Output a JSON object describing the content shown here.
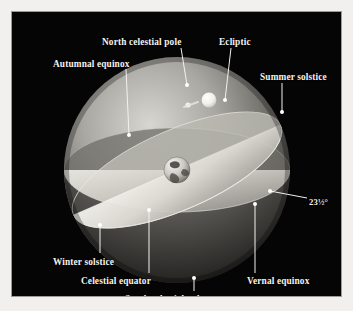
{
  "figure": {
    "background_color": "#f2f0ee",
    "panel_color": "#050505",
    "label_color": "#f4f2ee"
  },
  "labels": [
    {
      "id": "north-celestial-pole",
      "text": "North celestial pole",
      "x": 90,
      "y": 26,
      "anchor": "start",
      "leader": {
        "x1": 169,
        "y1": 36,
        "x2": 175,
        "y2": 73
      }
    },
    {
      "id": "ecliptic",
      "text": "Ecliptic",
      "x": 207,
      "y": 26,
      "anchor": "start",
      "leader": {
        "x1": 219,
        "y1": 36,
        "x2": 213,
        "y2": 88
      }
    },
    {
      "id": "autumnal-equinox",
      "text": "Autumnal equinox",
      "x": 41,
      "y": 48,
      "anchor": "start",
      "leader": {
        "x1": 114,
        "y1": 57,
        "x2": 117,
        "y2": 123
      }
    },
    {
      "id": "summer-solstice",
      "text": "Summer solstice",
      "x": 248,
      "y": 61,
      "anchor": "start",
      "leader": {
        "x1": 270,
        "y1": 71,
        "x2": 270,
        "y2": 100
      }
    },
    {
      "id": "tilt-angle",
      "text": "23½°",
      "x": 297,
      "y": 186,
      "anchor": "start",
      "leader": {
        "x1": 295,
        "y1": 186,
        "x2": 258,
        "y2": 179
      }
    },
    {
      "id": "winter-solstice",
      "text": "Winter solstice",
      "x": 41,
      "y": 246,
      "anchor": "start",
      "leader": {
        "x1": 88,
        "y1": 241,
        "x2": 88,
        "y2": 213
      }
    },
    {
      "id": "celestial-equator",
      "text": "Celestial equator",
      "x": 69,
      "y": 265,
      "anchor": "start",
      "leader": {
        "x1": 137,
        "y1": 261,
        "x2": 137,
        "y2": 198
      }
    },
    {
      "id": "vernal-equinox",
      "text": "Vernal equinox",
      "x": 235,
      "y": 265,
      "anchor": "start",
      "leader": {
        "x1": 243,
        "y1": 261,
        "x2": 243,
        "y2": 192
      }
    },
    {
      "id": "south-celestial-pole",
      "text": "South celestial pole",
      "x": 113,
      "y": 283,
      "anchor": "start",
      "leader": {
        "x1": 182,
        "y1": 279,
        "x2": 182,
        "y2": 266
      }
    }
  ],
  "sphere": {
    "center_x": 165,
    "center_y": 158,
    "radius": 113,
    "label": "celestial-sphere"
  },
  "bodies": [
    {
      "id": "earth",
      "name": "Earth",
      "cx": 165,
      "cy": 158,
      "r": 13
    },
    {
      "id": "sun",
      "name": "Sun",
      "cx": 197,
      "cy": 88,
      "r": 7
    },
    {
      "id": "sun-trail",
      "name": "Sun position marker",
      "cx": 176,
      "cy": 93,
      "r": 2.6
    }
  ],
  "discs": [
    {
      "id": "celestial-equator-plane",
      "name": "Celestial equator plane",
      "tilt_deg": 0
    },
    {
      "id": "ecliptic-plane",
      "name": "Ecliptic plane",
      "tilt_deg": 23.5
    }
  ]
}
